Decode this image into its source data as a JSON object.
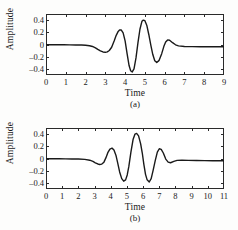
{
  "figure": {
    "background_color": "#fdfdfc",
    "line_color": "#1a1a1a",
    "axis_color": "#2a2a2a"
  },
  "chart_data": [
    {
      "type": "line",
      "panel_label": "(a)",
      "title": "",
      "xlabel": "Time",
      "ylabel": "Amplitude",
      "xlim": [
        0,
        9
      ],
      "ylim": [
        -0.5,
        0.5
      ],
      "grid": false,
      "legend": null,
      "xticks": [
        0,
        1,
        2,
        3,
        4,
        5,
        6,
        7,
        8,
        9
      ],
      "xtick_labels": [
        "0",
        "1",
        "2",
        "3",
        "4",
        "5",
        "6",
        "7",
        "8",
        "9"
      ],
      "yticks": [
        0.4,
        0.2,
        0,
        -0.2,
        -0.4
      ],
      "ytick_labels": [
        "0.4",
        "0.2",
        "0",
        "-0.2",
        "-0.4"
      ],
      "series": [
        {
          "name": "wavelet-a",
          "x": [
            0.0,
            0.3,
            0.6,
            0.9,
            1.2,
            1.5,
            1.8,
            2.0,
            2.2,
            2.35,
            2.5,
            2.62,
            2.75,
            2.88,
            3.0,
            3.1,
            3.2,
            3.32,
            3.45,
            3.55,
            3.65,
            3.72,
            3.8,
            3.9,
            4.0,
            4.1,
            4.2,
            4.28,
            4.36,
            4.45,
            4.55,
            4.65,
            4.75,
            4.85,
            4.92,
            5.0,
            5.1,
            5.2,
            5.3,
            5.4,
            5.5,
            5.6,
            5.72,
            5.85,
            5.96,
            6.05,
            6.15,
            6.25,
            6.4,
            6.55,
            6.7,
            7.0,
            7.4,
            7.8,
            8.2,
            8.6,
            9.0
          ],
          "y": [
            -0.005,
            -0.005,
            -0.005,
            -0.005,
            -0.006,
            -0.007,
            -0.009,
            -0.012,
            -0.02,
            -0.032,
            -0.055,
            -0.08,
            -0.105,
            -0.122,
            -0.128,
            -0.12,
            -0.098,
            -0.045,
            0.06,
            0.15,
            0.215,
            0.238,
            0.24,
            0.19,
            0.06,
            -0.15,
            -0.345,
            -0.43,
            -0.45,
            -0.4,
            -0.22,
            0.03,
            0.25,
            0.38,
            0.4,
            0.39,
            0.31,
            0.16,
            -0.01,
            -0.165,
            -0.265,
            -0.295,
            -0.26,
            -0.15,
            -0.03,
            0.04,
            0.075,
            0.07,
            0.03,
            -0.005,
            -0.022,
            -0.032,
            -0.035,
            -0.036,
            -0.037,
            -0.038,
            -0.038
          ]
        }
      ]
    },
    {
      "type": "line",
      "panel_label": "(b)",
      "title": "",
      "xlabel": "Time",
      "ylabel": "Amplitude",
      "xlim": [
        0,
        11
      ],
      "ylim": [
        -0.5,
        0.5
      ],
      "grid": false,
      "legend": null,
      "xticks": [
        0,
        1,
        2,
        3,
        4,
        5,
        6,
        7,
        8,
        9,
        10,
        11
      ],
      "xtick_labels": [
        "0",
        "1",
        "2",
        "3",
        "4",
        "5",
        "6",
        "7",
        "8",
        "9",
        "10",
        "11"
      ],
      "yticks": [
        0.4,
        0.2,
        0,
        -0.2,
        -0.4
      ],
      "ytick_labels": [
        "0.4",
        "0.2",
        "0",
        "-0.2",
        "-0.4"
      ],
      "series": [
        {
          "name": "wavelet-b",
          "x": [
            0.0,
            0.4,
            0.8,
            1.2,
            1.6,
            2.0,
            2.4,
            2.7,
            2.9,
            3.05,
            3.2,
            3.32,
            3.45,
            3.58,
            3.7,
            3.82,
            3.95,
            4.08,
            4.2,
            4.32,
            4.42,
            4.55,
            4.68,
            4.8,
            4.92,
            5.02,
            5.12,
            5.25,
            5.38,
            5.5,
            5.6,
            5.72,
            5.85,
            5.95,
            6.05,
            6.15,
            6.25,
            6.38,
            6.5,
            6.62,
            6.75,
            6.88,
            7.0,
            7.12,
            7.25,
            7.4,
            7.55,
            7.7,
            7.9,
            8.1,
            8.4,
            8.8,
            9.3,
            9.8,
            10.3,
            10.7,
            11.0
          ],
          "y": [
            -0.005,
            -0.005,
            -0.005,
            -0.006,
            -0.007,
            -0.009,
            -0.014,
            -0.028,
            -0.048,
            -0.07,
            -0.09,
            -0.098,
            -0.092,
            -0.06,
            0.01,
            0.095,
            0.155,
            0.17,
            0.14,
            0.055,
            -0.06,
            -0.22,
            -0.33,
            -0.372,
            -0.35,
            -0.27,
            -0.13,
            0.11,
            0.31,
            0.4,
            0.412,
            0.37,
            0.24,
            0.09,
            -0.1,
            -0.26,
            -0.35,
            -0.385,
            -0.33,
            -0.195,
            -0.035,
            0.105,
            0.16,
            0.15,
            0.09,
            -0.01,
            -0.06,
            -0.07,
            -0.048,
            -0.03,
            -0.028,
            -0.03,
            -0.033,
            -0.035,
            -0.036,
            -0.037,
            -0.038
          ]
        }
      ]
    }
  ]
}
